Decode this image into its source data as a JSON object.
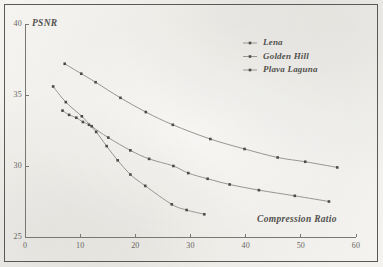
{
  "figure": {
    "background_color": "#f2f1ee",
    "border_color": "#4a4743",
    "line_color": "#8e8b86",
    "marker_color": "#3b3834",
    "text_color": "#403d39"
  },
  "chart_data": {
    "type": "line",
    "title": "",
    "xlabel": "Compression Ratio",
    "ylabel": "PSNR",
    "xlim": [
      0,
      60
    ],
    "ylim": [
      25,
      40
    ],
    "xticks": [
      0,
      10,
      20,
      30,
      40,
      50,
      60
    ],
    "yticks": [
      25,
      30,
      35,
      40
    ],
    "xtick_labels": [
      "0",
      "10",
      "20",
      "30",
      "40",
      "50",
      "60"
    ],
    "ytick_labels": [
      "25",
      "30",
      "35",
      "40"
    ],
    "grid": false,
    "legend_position": "upper right",
    "series": [
      {
        "name": "Lena",
        "marker": "square-dot",
        "x": [
          7.2,
          10.2,
          12.8,
          17.3,
          21.9,
          26.8,
          33.6,
          39.8,
          45.8,
          50.8,
          56.6
        ],
        "y": [
          37.2,
          36.5,
          35.9,
          34.8,
          33.8,
          32.9,
          31.9,
          31.2,
          30.6,
          30.3,
          29.9
        ]
      },
      {
        "name": "Golden Hill",
        "marker": "square-dot",
        "x": [
          5.1,
          7.4,
          10.3,
          12.1,
          15.1,
          19.1,
          22.5,
          26.9,
          29.6,
          33.1,
          37.1,
          42.4,
          48.9,
          55.1
        ],
        "y": [
          35.6,
          34.5,
          33.5,
          32.8,
          32.0,
          31.1,
          30.5,
          30.0,
          29.5,
          29.1,
          28.7,
          28.3,
          27.9,
          27.5
        ]
      },
      {
        "name": "Plava Laguna",
        "marker": "square-dot",
        "x": [
          6.8,
          8.0,
          9.3,
          10.5,
          11.6,
          12.9,
          14.8,
          16.8,
          19.1,
          21.8,
          26.6,
          29.3,
          32.5
        ],
        "y": [
          33.9,
          33.6,
          33.4,
          33.1,
          32.9,
          32.4,
          31.4,
          30.4,
          29.4,
          28.6,
          27.3,
          26.9,
          26.6
        ]
      }
    ]
  }
}
